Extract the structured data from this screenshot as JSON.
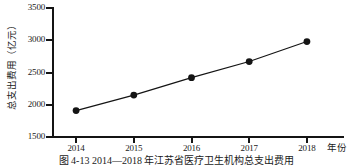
{
  "chart_data": {
    "type": "line",
    "title": "",
    "subtitle": "",
    "xlabel": "年份",
    "ylabel": "总支出费用（亿元）",
    "categories": [
      "2014",
      "2015",
      "2016",
      "2017",
      "2018"
    ],
    "x": [
      2014,
      2015,
      2016,
      2017,
      2018
    ],
    "values": [
      1910,
      2150,
      2420,
      2670,
      2980
    ],
    "series": [
      {
        "name": "总支出费用",
        "values": [
          1910,
          2150,
          2420,
          2670,
          2980
        ]
      }
    ],
    "xlim": [
      2013.6,
      2018.4
    ],
    "ylim": [
      1500,
      3500
    ],
    "ytick_labels": [
      "1500",
      "2000",
      "2500",
      "3000",
      "3500"
    ],
    "ytick_values": [
      1500,
      2000,
      2500,
      3000,
      3500
    ],
    "xtick_labels": [
      "2014",
      "2015",
      "2016",
      "2017",
      "2018"
    ],
    "grid": false,
    "legend": false,
    "legend_position": "none",
    "line_color": "#141414",
    "marker_color": "#141414",
    "marker": "circle",
    "background_color": "#ffffff",
    "axis_color": "#141414"
  },
  "caption": {
    "text": "图 4-13  2014—2018 年江苏省医疗卫生机构总支出费用"
  }
}
